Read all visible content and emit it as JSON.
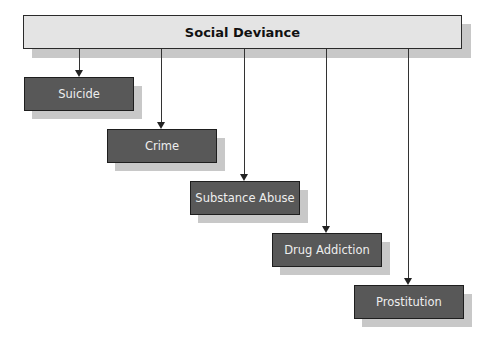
{
  "diagram": {
    "root": {
      "label": "Social Deviance"
    },
    "children": [
      {
        "label": "Suicide"
      },
      {
        "label": "Crime"
      },
      {
        "label": "Substance Abuse"
      },
      {
        "label": "Drug Addiction"
      },
      {
        "label": "Prostitution"
      }
    ]
  },
  "colors": {
    "root_fill": "#e4e4e4",
    "child_fill": "#585858",
    "shadow": "#c8c8c8",
    "child_text": "#eeeeee"
  }
}
